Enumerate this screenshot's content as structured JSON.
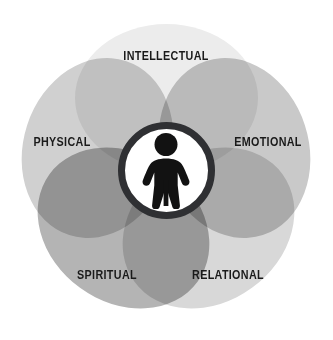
{
  "diagram": {
    "type": "venn-flower",
    "background_color": "#ffffff",
    "center": {
      "icon_name": "person-figure-icon",
      "icon_color": "#121212",
      "disc_fill": "#ffffff",
      "ring_color": "#2f3033",
      "ring_width_px": 7,
      "diameter_px": 97,
      "cx": 166,
      "cy": 170
    },
    "petals": [
      {
        "id": "intellectual",
        "label": "INTELLECTUAL",
        "color": "#ececec",
        "angle_deg": 0,
        "label_x": 166,
        "label_y": 57
      },
      {
        "id": "emotional",
        "label": "EMOTIONAL",
        "color": "#c9c9c9",
        "angle_deg": 72,
        "label_x": 268,
        "label_y": 143
      },
      {
        "id": "relational",
        "label": "RELATIONAL",
        "color": "#d8d8d8",
        "angle_deg": 144,
        "label_x": 228,
        "label_y": 276
      },
      {
        "id": "spiritual",
        "label": "SPIRITUAL",
        "color": "#b4b4b4",
        "angle_deg": 216,
        "label_x": 107,
        "label_y": 276
      },
      {
        "id": "physical",
        "label": "PHYSICAL",
        "color": "#d0d0d0",
        "angle_deg": 288,
        "label_x": 62,
        "label_y": 143
      }
    ],
    "label_color": "#1a1a1a"
  }
}
